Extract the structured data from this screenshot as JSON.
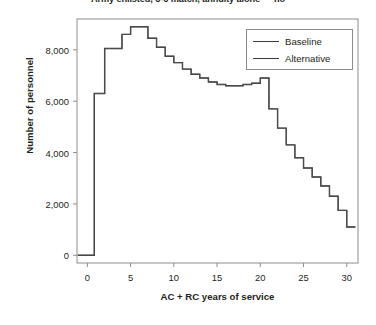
{
  "chart_data": {
    "type": "line",
    "title": "Army enlisted, 3-6 match, annuity alone — no",
    "xlabel": "AC + RC years of service",
    "ylabel": "Number of personnel",
    "xlim": [
      -1.2,
      31.3
    ],
    "ylim": [
      -300,
      9200
    ],
    "xticks": [
      0,
      5,
      10,
      15,
      20,
      25,
      30
    ],
    "xtick_labels": [
      "0",
      "5",
      "10",
      "15",
      "20",
      "25",
      "30"
    ],
    "yticks": [
      0,
      2000,
      4000,
      6000,
      8000
    ],
    "ytick_labels": [
      "0",
      "2,000",
      "4,000",
      "6,000",
      "8,000"
    ],
    "grid": false,
    "legend_position": "top-right",
    "step_style": "post",
    "legend": [
      "Baseline",
      "Alternative"
    ],
    "x": [
      0,
      1,
      2,
      3,
      4,
      5,
      6,
      7,
      8,
      9,
      10,
      11,
      12,
      13,
      14,
      15,
      16,
      17,
      18,
      19,
      20,
      21,
      22,
      23,
      24,
      25,
      26,
      27,
      28,
      29,
      30
    ],
    "series": [
      {
        "name": "Baseline",
        "color": "#333333",
        "values": [
          0,
          6300,
          8050,
          8050,
          8600,
          8900,
          8900,
          8450,
          8100,
          7750,
          7500,
          7250,
          7050,
          6900,
          6750,
          6650,
          6600,
          6600,
          6650,
          6700,
          6900,
          5700,
          4950,
          4300,
          3800,
          3400,
          3050,
          2700,
          2300,
          1750,
          1100
        ]
      },
      {
        "name": "Alternative",
        "color": "#555555",
        "values": [
          0,
          6300,
          8050,
          8050,
          8600,
          8900,
          8900,
          8450,
          8100,
          7750,
          7500,
          7250,
          7050,
          6900,
          6750,
          6650,
          6600,
          6600,
          6650,
          6700,
          6900,
          5700,
          4950,
          4300,
          3800,
          3400,
          3050,
          2700,
          2300,
          1750,
          1100
        ]
      }
    ],
    "start_x": 0.8,
    "axis_color": "#8d8d8d",
    "line_color": "#333333"
  },
  "plot_geometry": {
    "left": 77,
    "right": 358,
    "top": 19,
    "bottom": 263
  }
}
